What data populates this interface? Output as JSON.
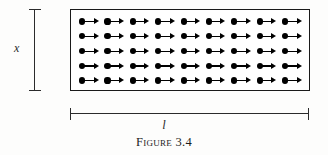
{
  "figure": {
    "caption": "Figure 3.4",
    "background_color": "#fdfdfc",
    "ink_color": "#1a1a1a"
  },
  "slab": {
    "name": "magnetized-slab",
    "border_color": "#1a1a1a",
    "fill_color": "#ffffff",
    "rows": 5,
    "columns": 9,
    "symbol": "dipole-arrow-right",
    "symbol_description": "filled dot with rightward arrow"
  },
  "dimensions": {
    "vertical": {
      "label": "x",
      "style": "italic",
      "line_color": "#2b2b2b",
      "has_end_caps": true
    },
    "horizontal": {
      "label": "l",
      "style": "italic",
      "line_color": "#2b2b2b",
      "has_end_caps": true
    }
  },
  "chart_data": {
    "type": "diagram",
    "title": "Figure 3.4",
    "annotations": [
      {
        "label": "x",
        "position": "left",
        "orientation": "vertical"
      },
      {
        "label": "l",
        "position": "bottom",
        "orientation": "horizontal"
      }
    ],
    "grid": {
      "rows": 5,
      "columns": 9,
      "arrow_direction": "right"
    }
  }
}
